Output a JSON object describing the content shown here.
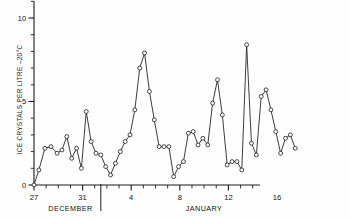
{
  "chart_data": {
    "type": "line",
    "title": "",
    "subtitle": "",
    "xlabel": "",
    "ylabel": "ICE CRYSTALS PER LITRE  –20°C",
    "ylim": [
      0,
      11
    ],
    "yticks": [
      0,
      5,
      10
    ],
    "ytick_labels": [
      "0",
      "5",
      "10"
    ],
    "yminor_step": 1,
    "grid": false,
    "legend": null,
    "marker": "open-circle",
    "xlim": [
      27,
      45
    ],
    "xtick_positions": [
      27,
      31,
      35,
      39,
      43,
      47
    ],
    "xtick_labels": [
      "27",
      "31",
      "4",
      "8",
      "12",
      "16"
    ],
    "xminor_step": 1,
    "month_separator_x": 32.5,
    "month_labels": [
      {
        "text": "DECEMBER",
        "x": 30.0
      },
      {
        "text": "JANUARY",
        "x": 41.0
      }
    ],
    "x": [
      27.0,
      27.4,
      27.9,
      28.4,
      28.9,
      29.3,
      29.7,
      30.1,
      30.5,
      30.9,
      31.3,
      31.7,
      32.1,
      32.5,
      32.9,
      33.3,
      33.7,
      34.1,
      34.5,
      34.9,
      35.3,
      35.7,
      36.1,
      36.5,
      36.9,
      37.3,
      37.7,
      38.1,
      38.5,
      38.9,
      39.3,
      39.7,
      40.1,
      40.5,
      40.9,
      41.3,
      41.7,
      42.1,
      42.5,
      42.9,
      43.3,
      43.7,
      44.1,
      44.5,
      44.9,
      45.3,
      45.7,
      46.1,
      46.5,
      46.9,
      47.3,
      47.7,
      48.1,
      48.5
    ],
    "values": [
      0.0,
      0.9,
      2.2,
      2.3,
      1.9,
      2.1,
      2.9,
      1.6,
      2.2,
      1.0,
      4.4,
      2.6,
      1.9,
      1.8,
      1.1,
      0.6,
      1.3,
      2.0,
      2.6,
      3.0,
      4.5,
      7.0,
      7.9,
      5.6,
      3.9,
      2.3,
      2.3,
      2.3,
      0.5,
      1.1,
      1.4,
      3.1,
      3.2,
      2.4,
      2.8,
      2.4,
      4.9,
      6.3,
      4.2,
      1.2,
      1.4,
      1.4,
      0.9,
      8.4,
      2.5,
      1.8,
      5.3,
      5.7,
      4.5,
      3.2,
      1.9,
      2.8,
      3.0,
      2.2
    ],
    "series": [
      {
        "name": "ice crystal concentration",
        "marker": "open-circle",
        "line_color": "#1a1a1a",
        "marker_face": "#ffffff",
        "marker_edge": "#1a1a1a"
      }
    ],
    "axis_color": "#1a1a1a",
    "background": "#fefefe"
  },
  "axes": {
    "y_axis_name": "ice-crystals-axis",
    "x_axis_name": "date-axis"
  }
}
